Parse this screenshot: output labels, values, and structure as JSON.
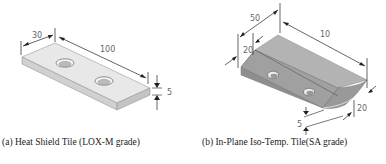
{
  "figure": {
    "panels": [
      {
        "id": "a",
        "caption": "(a) Heat Shield Tile (LOX-M grade)",
        "dimensions": {
          "width": "30",
          "length": "100",
          "thickness": "5"
        }
      },
      {
        "id": "b",
        "caption": "(b) In-Plane Iso-Temp. Tile(SA grade)",
        "dimensions": {
          "width": "50",
          "length": "10",
          "edge_top": "20",
          "edge_right": "20",
          "thickness": "5"
        }
      }
    ],
    "colors": {
      "tile_a_top": "#e6e6e6",
      "tile_a_side": "#cfcfcf",
      "tile_b_top": "#a9a9a9",
      "tile_b_bevel": "#8f8f8f",
      "dimension_line": "#222222",
      "dimension_text": "#666666"
    }
  }
}
